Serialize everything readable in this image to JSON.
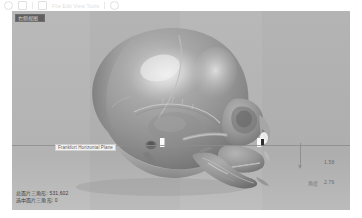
{
  "app": {
    "toolbar_hint": "File  Edit  View  Tools"
  },
  "viewport": {
    "view_badge": "右侧视图",
    "background_color": "#b3b3b3"
  },
  "reference_plane": {
    "label": "Frankfort Horizontal Plane",
    "line_color": "#8d8d8d"
  },
  "measurements": {
    "value_1": "1.58",
    "label_2": "角度",
    "value_2": "2.76",
    "axis_color": "#8f8f8f"
  },
  "mesh_stats": {
    "lines": [
      "总面片三角形: 531,602",
      "选中面片三角形: 0"
    ]
  },
  "model": {
    "name": "skull-3d-reconstruction",
    "surface_color": "#9a9a9a",
    "highlight_color": "#e8e8e8",
    "shadow_color": "#6b6b6b"
  }
}
